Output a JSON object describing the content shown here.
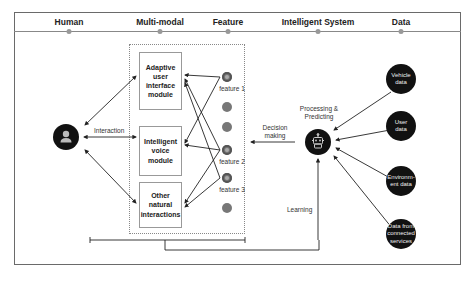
{
  "header": {
    "columns": [
      {
        "label": "Human",
        "x": 69
      },
      {
        "label": "Multi-modal",
        "x": 160
      },
      {
        "label": "Feature",
        "x": 228
      },
      {
        "label": "Intelligent System",
        "x": 318
      },
      {
        "label": "Data",
        "x": 401
      }
    ]
  },
  "human": {
    "icon": "person-icon",
    "interaction_label": "Interaction"
  },
  "modules": [
    {
      "label": "Adaptive user interface module"
    },
    {
      "label": "Intelligent voice module"
    },
    {
      "label": "Other natural interactions"
    }
  ],
  "features": {
    "labels": [
      "feature 1",
      "feature 2",
      "feature 3"
    ]
  },
  "system": {
    "title": "Processing & Predicting",
    "icon": "robot-icon",
    "decision_label": "Decision making",
    "learning_label": "Learning"
  },
  "data_sources": [
    {
      "label": "Vehicle data"
    },
    {
      "label": "User data"
    },
    {
      "label": "Environm-ent data"
    },
    {
      "label": "Data from connected services"
    }
  ],
  "colors": {
    "node_fill": "#111111",
    "feature_fill": "#777777",
    "line": "#333333",
    "frame": "#6a6a6a"
  }
}
